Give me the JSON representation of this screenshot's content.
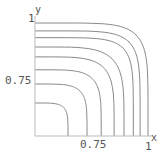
{
  "chart_data": {
    "type": "contour",
    "title": "",
    "xlabel": "x",
    "ylabel": "y",
    "xlim": [
      0.5,
      1
    ],
    "ylim": [
      0.5,
      1
    ],
    "x_ticks": [
      "0.75",
      "1"
    ],
    "y_ticks": [
      "0.75",
      "1"
    ],
    "grid": false,
    "contour_levels_axis_intercepts": [
      1.0,
      0.965,
      0.935,
      0.894,
      0.85,
      0.793,
      0.73,
      0.646
    ],
    "contour_shape": "symmetric superellipse-like curves about the diagonal, convex toward upper-right",
    "line_color": "#888888",
    "axis_color": "#bbbbbb"
  },
  "labels": {
    "x_axis_name": "x",
    "y_axis_name": "y",
    "x_tick_075": "0.75",
    "x_tick_1": "1",
    "y_tick_075": "0.75",
    "y_tick_1": "1"
  }
}
